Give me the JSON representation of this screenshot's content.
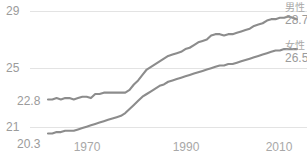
{
  "chart_data": {
    "type": "line",
    "title": "",
    "subtitle": "",
    "xlabel": "",
    "ylabel": "",
    "xlim": [
      1955,
      2013
    ],
    "ylim": [
      19.6,
      29.3
    ],
    "grid": true,
    "legend_position": "right-inline",
    "y_ticks": [
      "29",
      "25",
      "21"
    ],
    "y_tick_values": [
      29,
      25,
      21
    ],
    "x_ticks": [
      "1970",
      "1990",
      "2010"
    ],
    "x_tick_values": [
      1970,
      1990,
      2010
    ],
    "annotations": [
      {
        "name": "male-start-label",
        "text": "22.8",
        "x": 1955,
        "y": 22.8
      },
      {
        "name": "female-start-label",
        "text": "20.3",
        "x": 1955,
        "y": 20.3
      },
      {
        "name": "male-end-label",
        "text": "28.7",
        "x": 2013,
        "y": 28.7
      },
      {
        "name": "female-end-label",
        "text": "26.5",
        "x": 2013,
        "y": 26.5
      }
    ],
    "series": [
      {
        "name": "男性",
        "value_label": "28.7",
        "color": "#8c8c8c",
        "start_value": 22.8,
        "end_value": 28.7,
        "x": [
          1955,
          1956,
          1957,
          1958,
          1959,
          1960,
          1961,
          1962,
          1963,
          1964,
          1965,
          1966,
          1967,
          1968,
          1969,
          1970,
          1971,
          1972,
          1973,
          1974,
          1975,
          1976,
          1977,
          1978,
          1979,
          1980,
          1981,
          1982,
          1983,
          1984,
          1985,
          1986,
          1987,
          1988,
          1989,
          1990,
          1991,
          1992,
          1993,
          1994,
          1995,
          1996,
          1997,
          1998,
          1999,
          2000,
          2001,
          2002,
          2003,
          2004,
          2005,
          2006,
          2007,
          2008,
          2009,
          2010,
          2011,
          2012,
          2013
        ],
        "values": [
          22.8,
          22.8,
          22.9,
          22.8,
          22.9,
          22.9,
          22.8,
          22.9,
          23.0,
          23.0,
          22.9,
          23.2,
          23.2,
          23.3,
          23.3,
          23.3,
          23.3,
          23.3,
          23.3,
          23.5,
          23.9,
          24.2,
          24.6,
          25.0,
          25.2,
          25.4,
          25.6,
          25.8,
          26.0,
          26.1,
          26.2,
          26.3,
          26.5,
          26.6,
          26.8,
          27.0,
          27.1,
          27.2,
          27.5,
          27.6,
          27.6,
          27.5,
          27.6,
          27.6,
          27.7,
          27.8,
          27.9,
          28.0,
          28.2,
          28.3,
          28.4,
          28.6,
          28.7,
          28.7,
          28.8,
          28.8,
          28.9,
          28.8,
          28.7
        ]
      },
      {
        "name": "女性",
        "value_label": "26.5",
        "color": "#8c8c8c",
        "start_value": 20.3,
        "end_value": 26.5,
        "x": [
          1955,
          1956,
          1957,
          1958,
          1959,
          1960,
          1961,
          1962,
          1963,
          1964,
          1965,
          1966,
          1967,
          1968,
          1969,
          1970,
          1971,
          1972,
          1973,
          1974,
          1975,
          1976,
          1977,
          1978,
          1979,
          1980,
          1981,
          1982,
          1983,
          1984,
          1985,
          1986,
          1987,
          1988,
          1989,
          1990,
          1991,
          1992,
          1993,
          1994,
          1995,
          1996,
          1997,
          1998,
          1999,
          2000,
          2001,
          2002,
          2003,
          2004,
          2005,
          2006,
          2007,
          2008,
          2009,
          2010,
          2011,
          2012,
          2013
        ],
        "values": [
          20.3,
          20.3,
          20.4,
          20.4,
          20.5,
          20.5,
          20.5,
          20.6,
          20.7,
          20.8,
          20.9,
          21.0,
          21.1,
          21.2,
          21.3,
          21.4,
          21.5,
          21.6,
          21.8,
          22.1,
          22.4,
          22.7,
          23.0,
          23.2,
          23.4,
          23.6,
          23.8,
          23.9,
          24.1,
          24.2,
          24.3,
          24.4,
          24.5,
          24.6,
          24.7,
          24.8,
          24.9,
          25.0,
          25.1,
          25.2,
          25.3,
          25.3,
          25.4,
          25.4,
          25.5,
          25.6,
          25.7,
          25.8,
          25.9,
          26.0,
          26.1,
          26.2,
          26.3,
          26.4,
          26.4,
          26.5,
          26.5,
          26.5,
          26.5
        ]
      }
    ],
    "source_note": ""
  },
  "axis": {
    "y_top_label": "29",
    "y_mid_label": "25",
    "y_low_label": "21",
    "male_start_label": "22.8",
    "female_start_label": "20.3",
    "x_first": "1970",
    "x_second": "1990",
    "x_third": "2010"
  },
  "legend": {
    "male_name": "男性",
    "male_value": "28.7",
    "female_name": "女性",
    "female_value": "26.5"
  }
}
